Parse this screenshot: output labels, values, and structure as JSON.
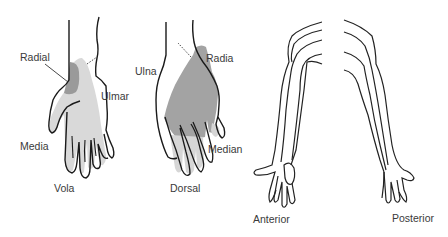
{
  "figure": {
    "colors": {
      "outline": "#1a1a1a",
      "median_region": "#d9d9d9",
      "radial_region": "#9a9a9a",
      "dorsal_radial_region": "#a3a3a3",
      "dorsal_median_region": "#d6d6d6",
      "background": "#ffffff",
      "label_text": "#3a3a3a"
    },
    "panels": [
      {
        "id": "vola",
        "title": "Vola",
        "labels": [
          "Radial",
          "Ulmar",
          "Media"
        ]
      },
      {
        "id": "dorsal",
        "title": "Dorsal",
        "labels": [
          "Ulna",
          "Radia",
          "Median"
        ]
      },
      {
        "id": "anterior",
        "title": "Anterior"
      },
      {
        "id": "posterior",
        "title": "Posterior"
      }
    ]
  },
  "labels": {
    "radial": "Radial",
    "ulmar": "Ulmar",
    "media": "Media",
    "vola": "Vola",
    "ulna": "Ulna",
    "radia": "Radia",
    "median": "Median",
    "dorsal": "Dorsal",
    "anterior": "Anterior",
    "posterior": "Posterior"
  }
}
